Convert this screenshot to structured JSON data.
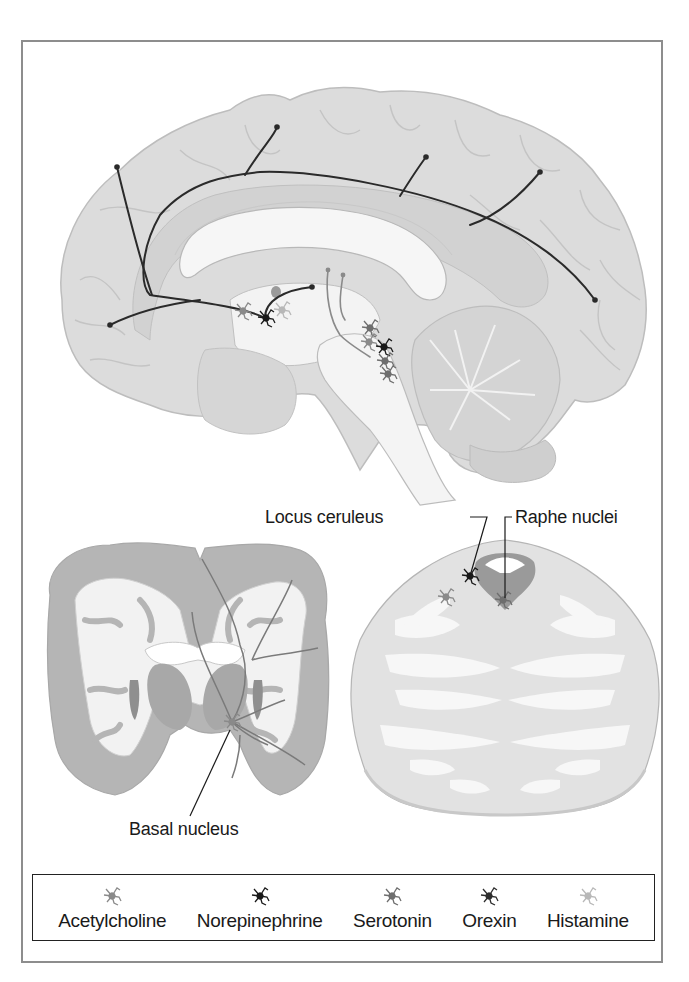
{
  "figure": {
    "type": "neuroanatomy illustration",
    "panels": [
      {
        "id": "sagittal",
        "description": "Midsagittal brain section showing projection pathways"
      },
      {
        "id": "coronal",
        "description": "Coronal brain section showing basal nucleus projections"
      },
      {
        "id": "brainstem",
        "description": "Transverse brainstem (pons) section"
      }
    ]
  },
  "labels": {
    "locus_ceruleus": "Locus ceruleus",
    "raphe_nuclei": "Raphe nuclei",
    "basal_nucleus": "Basal nucleus"
  },
  "legend": {
    "items": [
      {
        "label": "Acetylcholine",
        "icon": "neuron-acetylcholine-icon",
        "color": "#8a8a8a"
      },
      {
        "label": "Norepinephrine",
        "icon": "neuron-norepinephrine-icon",
        "color": "#1a1a1a"
      },
      {
        "label": "Serotonin",
        "icon": "neuron-serotonin-icon",
        "color": "#6e6e6e"
      },
      {
        "label": "Orexin",
        "icon": "neuron-orexin-icon",
        "color": "#2e2e2e"
      },
      {
        "label": "Histamine",
        "icon": "neuron-histamine-icon",
        "color": "#b8b8b8"
      }
    ]
  },
  "colors": {
    "brain_fill": "#dcdcdc",
    "brain_stroke": "#bdbdbd",
    "white_matter": "#f6f6f6",
    "coronal_gray": "#b5b5b5",
    "pathway_dark": "#2a2a2a",
    "pathway_mid": "#7a7a7a",
    "frame": "#8d8d8d"
  }
}
